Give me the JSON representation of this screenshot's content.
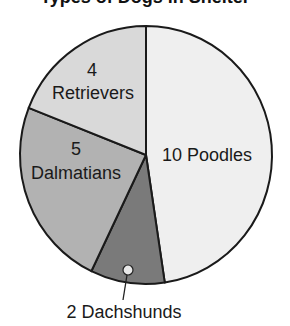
{
  "chart_data": {
    "type": "pie",
    "title": "Types of Dogs in Shelter",
    "title_visible_fragment": "partially cropped at top edge",
    "total": 21,
    "start_angle_deg": 0,
    "direction": "clockwise",
    "slices": [
      {
        "name": "Poodles",
        "value": 10,
        "label": "10 Poodles",
        "color": "#efefef"
      },
      {
        "name": "Dachshunds",
        "value": 2,
        "label": "2 Dachshunds",
        "color": "#7a7a7a"
      },
      {
        "name": "Dalmatians",
        "value": 5,
        "label_value": "5",
        "label_name": "Dalmatians",
        "color": "#b2b2b2"
      },
      {
        "name": "Retrievers",
        "value": 4,
        "label_value": "4",
        "label_name": "Retrievers",
        "color": "#d9d9d9"
      }
    ],
    "legend": "none (direct labels)",
    "annotations": [
      "leader line from Dachshunds slice to external label"
    ]
  },
  "labels": {
    "poodles": "10 Poodles",
    "dachshunds": "2 Dachshunds",
    "dalmatians_value": "5",
    "dalmatians_name": "Dalmatians",
    "retrievers_value": "4",
    "retrievers_name": "Retrievers"
  },
  "title": "Types of Dogs in Shelter"
}
